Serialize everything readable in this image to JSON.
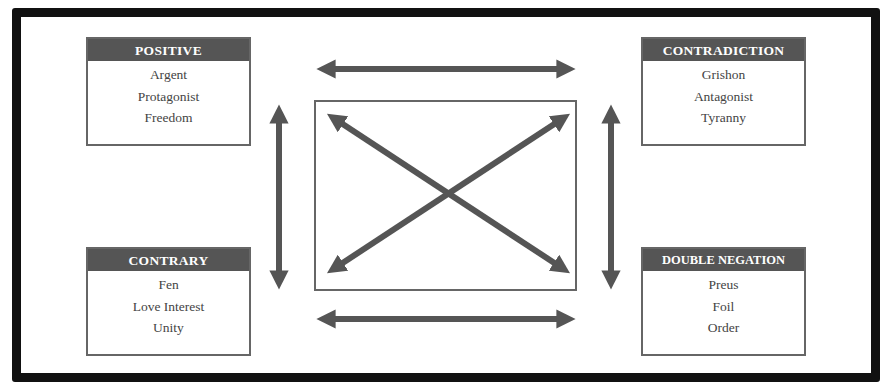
{
  "diagram": {
    "colors": {
      "frame": "#111111",
      "header_bg": "#555555",
      "header_text": "#ffffff",
      "item_text": "#444444",
      "arrow": "#555555",
      "box_border": "#666666"
    },
    "boxes": {
      "positive": {
        "header": "POSITIVE",
        "items": [
          "Argent",
          "Protagonist",
          "Freedom"
        ]
      },
      "contradiction": {
        "header": "CONTRADICTION",
        "items": [
          "Grishon",
          "Antagonist",
          "Tyranny"
        ]
      },
      "contrary": {
        "header": "CONTRARY",
        "items": [
          "Fen",
          "Love Interest",
          "Unity"
        ]
      },
      "double_negation": {
        "header": "DOUBLE NEGATION",
        "items": [
          "Preus",
          "Foil",
          "Order"
        ]
      }
    },
    "arrows": [
      {
        "name": "top-horizontal",
        "from": "positive",
        "to": "contradiction",
        "type": "double"
      },
      {
        "name": "bottom-horizontal",
        "from": "contrary",
        "to": "double_negation",
        "type": "double"
      },
      {
        "name": "left-vertical",
        "from": "positive",
        "to": "contrary",
        "type": "double"
      },
      {
        "name": "right-vertical",
        "from": "contradiction",
        "to": "double_negation",
        "type": "double"
      },
      {
        "name": "diagonal-positive-double-negation",
        "from": "positive",
        "to": "double_negation",
        "type": "double"
      },
      {
        "name": "diagonal-contradiction-contrary",
        "from": "contradiction",
        "to": "contrary",
        "type": "double"
      }
    ]
  }
}
